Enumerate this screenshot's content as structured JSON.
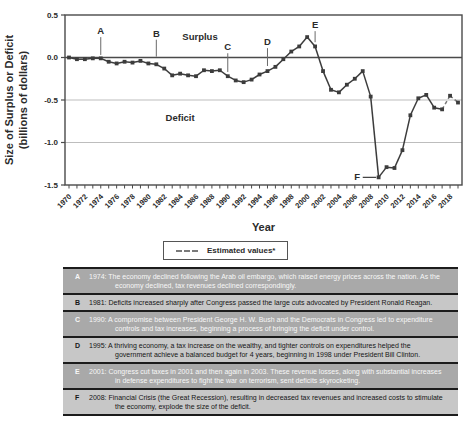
{
  "colors": {
    "line": "#3c3c3c",
    "estimated_line": "#7a7a7a",
    "grid": "#bdbdbd",
    "axis": "#4a4a4a",
    "text": "#2b2b2b",
    "row_dark_bg": "#a9a9a9",
    "row_dark_text": "#f7f7f7",
    "row_light_bg": "#c7c7c7",
    "row_light_text": "#161616",
    "divider": "#1c1c1c"
  },
  "chart": {
    "legend_label": "Estimated values*"
  },
  "chart_data": {
    "type": "line",
    "xlabel": "Year",
    "ylabel_line1": "Size of Surplus or Deficit",
    "ylabel_line2": "(billions of dollars)",
    "ylim": [
      -1.5,
      0.5
    ],
    "yticks": [
      0.5,
      0.0,
      -0.5,
      -1.0,
      -1.5
    ],
    "ytick_labels": [
      "0.5",
      "0.0",
      "-0.5",
      "-1.0",
      "-1.5"
    ],
    "xtick_label_every": 2,
    "gridlines": [
      -0.5,
      -1.0
    ],
    "zero_line": 0,
    "estimated_from_year": 2018,
    "x": [
      1970,
      1971,
      1972,
      1973,
      1974,
      1975,
      1976,
      1977,
      1978,
      1979,
      1980,
      1981,
      1982,
      1983,
      1984,
      1985,
      1986,
      1987,
      1988,
      1989,
      1990,
      1991,
      1992,
      1993,
      1994,
      1995,
      1996,
      1997,
      1998,
      1999,
      2000,
      2001,
      2002,
      2003,
      2004,
      2005,
      2006,
      2007,
      2008,
      2009,
      2010,
      2011,
      2012,
      2013,
      2014,
      2015,
      2016,
      2017,
      2018,
      2019
    ],
    "values": [
      0.0,
      -0.02,
      -0.02,
      -0.01,
      -0.01,
      -0.05,
      -0.07,
      -0.05,
      -0.06,
      -0.04,
      -0.07,
      -0.08,
      -0.13,
      -0.21,
      -0.19,
      -0.21,
      -0.22,
      -0.15,
      -0.16,
      -0.15,
      -0.22,
      -0.27,
      -0.29,
      -0.26,
      -0.2,
      -0.16,
      -0.11,
      -0.02,
      0.07,
      0.13,
      0.24,
      0.13,
      -0.16,
      -0.38,
      -0.41,
      -0.32,
      -0.25,
      -0.16,
      -0.46,
      -1.41,
      -1.29,
      -1.3,
      -1.09,
      -0.68,
      -0.48,
      -0.44,
      -0.59,
      -0.61,
      -0.45,
      -0.53
    ],
    "region_labels": [
      {
        "text": "Surplus",
        "year": 1986.5,
        "value": 0.21
      },
      {
        "text": "Deficit",
        "year": 1984.0,
        "value": -0.75
      }
    ],
    "annotations": [
      {
        "label": "A",
        "year": 1974,
        "letter_value": 0.31,
        "line_from": 0.24,
        "line_to": 0.03
      },
      {
        "label": "B",
        "year": 1981,
        "letter_value": 0.28,
        "line_from": 0.21,
        "line_to": 0.01
      },
      {
        "label": "C",
        "year": 1990,
        "letter_value": 0.12,
        "line_from": 0.05,
        "line_to": -0.17
      },
      {
        "label": "D",
        "year": 1995,
        "letter_value": 0.18,
        "line_from": 0.11,
        "line_to": -0.1
      },
      {
        "label": "E",
        "year": 2001,
        "letter_value": 0.38,
        "line_from": 0.31,
        "line_to": 0.18
      }
    ],
    "f_annotation": {
      "label": "F",
      "value": -1.41,
      "letter_year": 2006.3,
      "line_from_year": 2007.0,
      "line_to_year": 2008.7
    }
  },
  "table": {
    "rows": [
      {
        "letter": "A",
        "text": "1974: The economy declined following the Arab oil embargo, which raised energy prices across the nation. As the economy declined, tax revenues declined correspondingly."
      },
      {
        "letter": "B",
        "text": "1981: Deficits increased sharply after Congress passed the large cuts advocated by President Ronald Reagan."
      },
      {
        "letter": "C",
        "text": "1990: A compromise between President George H. W. Bush and the Democrats in Congress led to expenditure controls and tax increases, beginning a process of bringing the deficit under control."
      },
      {
        "letter": "D",
        "text": "1995: A thriving economy, a tax increase on the wealthy, and tighter controls on expenditures helped the government achieve a balanced budget for 4 years, beginning in 1998 under President Bill Clinton."
      },
      {
        "letter": "E",
        "text": "2001: Congress cut taxes in 2001 and then again in 2003. These revenue losses, along with substantial increases in defense expenditures to fight the war on terrorism, sent deficits skyrocketing."
      },
      {
        "letter": "F",
        "text": "2008: Financial Crisis (the Great Recession), resulting in decreased tax revenues and increased costs to stimulate the economy, explode the size of the deficit."
      }
    ]
  }
}
